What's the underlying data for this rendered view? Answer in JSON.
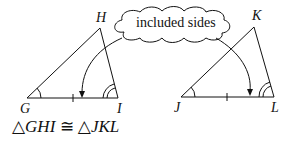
{
  "figure": {
    "callout": "included sides",
    "triangle1": {
      "vertices": [
        "G",
        "H",
        "I"
      ]
    },
    "triangle2": {
      "vertices": [
        "J",
        "K",
        "L"
      ]
    },
    "caption": {
      "left": "GHI",
      "symbol": "≅",
      "right": "JKL",
      "triangle_glyph": "△"
    }
  }
}
